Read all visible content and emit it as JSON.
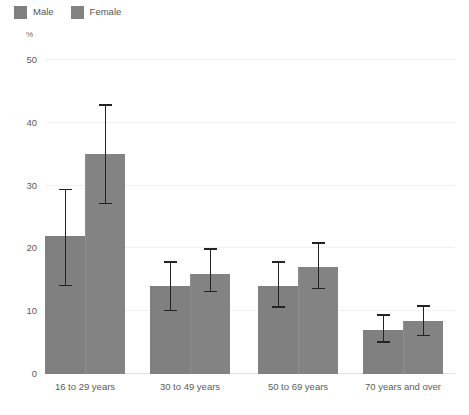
{
  "chart_data": {
    "type": "bar",
    "title": "",
    "subtitle": "",
    "xlabel": "",
    "ylabel": "%",
    "unit_label": "%",
    "ylim": [
      0,
      50
    ],
    "yticks": [
      0,
      10,
      20,
      30,
      40,
      50
    ],
    "ytick_labels": [
      "0",
      "10",
      "20",
      "30",
      "40",
      "50"
    ],
    "grid": true,
    "grid_axis": "y",
    "legend_position": "top-left",
    "categories": [
      "16 to 29 years",
      "30 to 49 years",
      "50 to 69 years",
      "70 years and over"
    ],
    "series": [
      {
        "name": "Male",
        "color": "#808080",
        "values": [
          22,
          14,
          14,
          7
        ],
        "error_low": [
          14,
          10,
          10.5,
          5
        ],
        "error_high": [
          29.5,
          18,
          18,
          9.5
        ]
      },
      {
        "name": "Female",
        "color": "#838383",
        "values": [
          35,
          16,
          17,
          8.5
        ],
        "error_low": [
          27,
          13,
          13.5,
          6
        ],
        "error_high": [
          43,
          20,
          21,
          11
        ]
      }
    ],
    "error_bar_color": "#232323",
    "gridline_color": "#f1f1f1",
    "background_color": "#ffffff"
  }
}
